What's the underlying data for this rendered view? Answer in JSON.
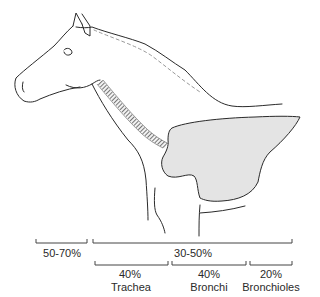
{
  "figure": {
    "colors": {
      "line": "#2a2a2a",
      "lung_fill": "#e4e4e4",
      "trachea_ring": "#555555"
    }
  },
  "brackets": {
    "upper_airway": {
      "value": "50-70%"
    },
    "lower_airway": {
      "value": "30-50%"
    },
    "trachea": {
      "value": "40%",
      "label": "Trachea"
    },
    "bronchi": {
      "value": "40%",
      "label": "Bronchi"
    },
    "bronchioles": {
      "value": "20%",
      "label": "Bronchioles"
    }
  }
}
